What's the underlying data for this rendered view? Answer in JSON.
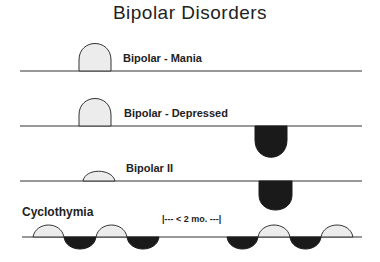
{
  "title": "Bipolar Disorders",
  "rows": [
    {
      "label": "Bipolar - Mania"
    },
    {
      "label": "Bipolar - Depressed"
    },
    {
      "label": "Bipolar II"
    },
    {
      "label": "Cyclothymia"
    }
  ],
  "annotation": "|---  < 2 mo.  ---|",
  "colors": {
    "mania_fill": "#ececec",
    "depression_fill": "#1a1a1a",
    "line": "#333333"
  }
}
